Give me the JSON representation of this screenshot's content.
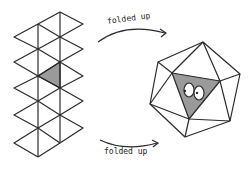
{
  "labels": {
    "top": "folded up",
    "bottom": "folded up"
  },
  "figure": {
    "net": "icosahedron net (20 triangles, one shaded)",
    "solid": "icosahedron with shaded face showing eyes"
  },
  "colors": {
    "line": "#2a2a2a",
    "shade": "#9a9a9a",
    "background": "#ffffff"
  }
}
